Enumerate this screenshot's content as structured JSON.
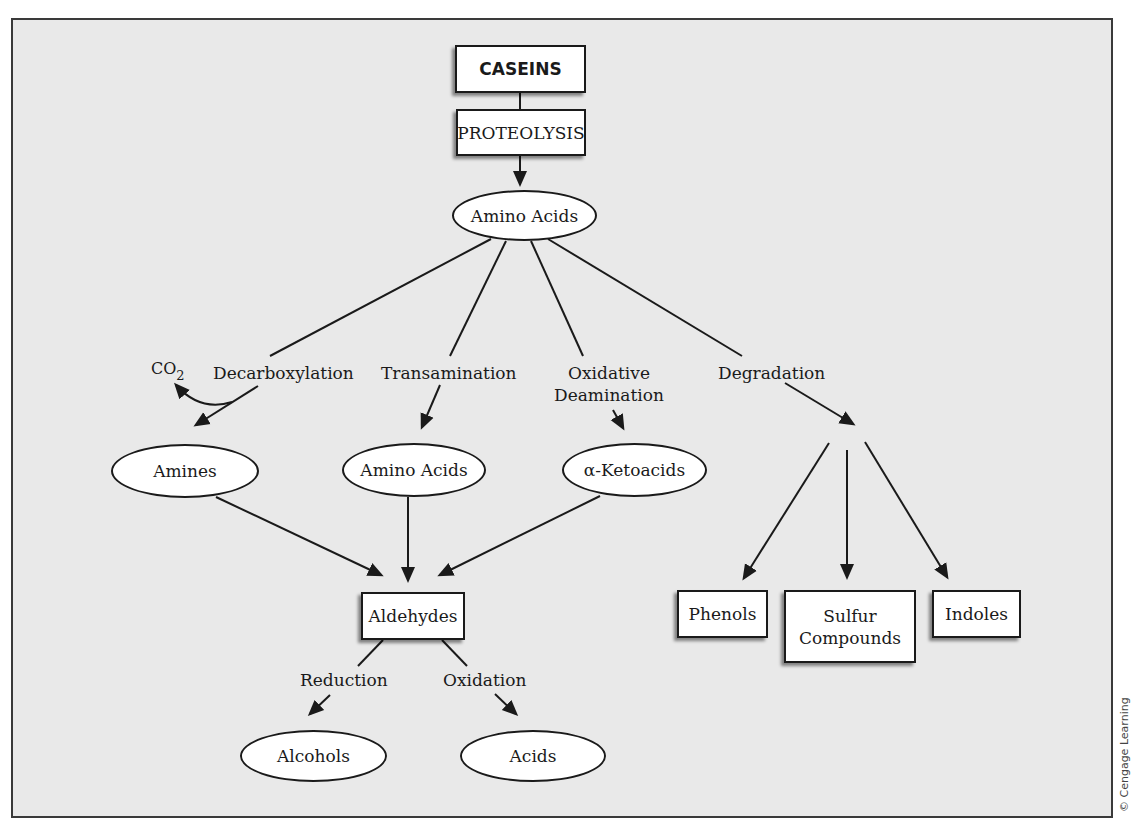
{
  "diagram": {
    "nodes": {
      "caseins": "CASEINS",
      "proteolysis": "PROTEOLYSIS",
      "amino_acids_top": "Amino Acids",
      "amines": "Amines",
      "amino_acids_mid": "Amino Acids",
      "ketoacids": "α-Ketoacids",
      "aldehydes": "Aldehydes",
      "alcohols": "Alcohols",
      "acids": "Acids",
      "phenols": "Phenols",
      "sulfur_compounds": "Sulfur Compounds",
      "indoles": "Indoles"
    },
    "processes": {
      "decarboxylation": "Decarboxylation",
      "transamination": "Transamination",
      "oxidative_deamination_line1": "Oxidative",
      "oxidative_deamination_line2": "Deamination",
      "degradation": "Degradation",
      "reduction": "Reduction",
      "oxidation": "Oxidation"
    },
    "byproduct": {
      "co2_main": "CO",
      "co2_sub": "2"
    },
    "sulfur_line1": "Sulfur",
    "sulfur_line2": "Compounds",
    "credit": "© Cengage Learning",
    "colors": {
      "background": "#e9e9e9",
      "node_fill": "#ffffff",
      "stroke": "#1a1a1a"
    },
    "edges": [
      {
        "from": "caseins",
        "to": "proteolysis",
        "arrow": false
      },
      {
        "from": "proteolysis",
        "to": "amino_acids_top",
        "arrow": true
      },
      {
        "from": "amino_acids_top",
        "to": "amines",
        "via": "decarboxylation"
      },
      {
        "from": "amino_acids_top",
        "to": "amino_acids_mid",
        "via": "transamination"
      },
      {
        "from": "amino_acids_top",
        "to": "ketoacids",
        "via": "oxidative_deamination"
      },
      {
        "from": "amino_acids_top",
        "to": "degradation_products",
        "via": "degradation"
      },
      {
        "from": "decarboxylation",
        "to": "co2",
        "arrow": true
      },
      {
        "from": "amines",
        "to": "aldehydes",
        "arrow": true
      },
      {
        "from": "amino_acids_mid",
        "to": "aldehydes",
        "arrow": true
      },
      {
        "from": "ketoacids",
        "to": "aldehydes",
        "arrow": true
      },
      {
        "from": "aldehydes",
        "to": "alcohols",
        "via": "reduction"
      },
      {
        "from": "aldehydes",
        "to": "acids",
        "via": "oxidation"
      },
      {
        "from": "degradation",
        "to": "phenols",
        "arrow": true
      },
      {
        "from": "degradation",
        "to": "sulfur_compounds",
        "arrow": true
      },
      {
        "from": "degradation",
        "to": "indoles",
        "arrow": true
      }
    ]
  }
}
